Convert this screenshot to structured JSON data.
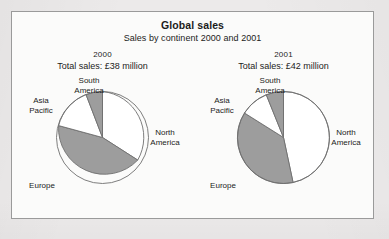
{
  "header": {
    "title": "Global sales",
    "subtitle": "Sales by continent 2000 and 2001"
  },
  "colors": {
    "page_background": "#eceaea",
    "panel_background": "#fbfbfa",
    "panel_border": "#9a9a9a",
    "slice_gray": "#9d9d9d",
    "slice_white": "#ffffff",
    "slice_outline": "#6f6f6f",
    "text": "#1b1b1b"
  },
  "charts": [
    {
      "year": "2000",
      "total": "Total sales: £38 million",
      "labels": {
        "north_america": "North\nAmerica",
        "europe": "Europe",
        "asia_pacific": "Asia\nPacific",
        "south_america": "South\nAmerica"
      }
    },
    {
      "year": "2001",
      "total": "Total sales: £42 million",
      "labels": {
        "north_america": "North\nAmerica",
        "europe": "Europe",
        "asia_pacific": "Asia\nPacific",
        "south_america": "South\nAmerica"
      }
    }
  ],
  "chart_data": [
    {
      "type": "pie",
      "title": "2000",
      "subtitle": "Total sales: £38 million",
      "total_label": "£38 million",
      "total_value": 38,
      "units": "£ million",
      "categories": [
        "North America",
        "Europe",
        "Asia Pacific",
        "South America"
      ],
      "values": [
        36,
        43,
        15,
        6
      ],
      "value_units": "percent",
      "angles_deg": [
        130,
        155,
        54,
        21
      ],
      "start_angle_deg": 0,
      "direction": "clockwise",
      "fills": [
        "#ffffff",
        "#9d9d9d",
        "#ffffff",
        "#9d9d9d"
      ],
      "legend": "none",
      "labels_position": "outside"
    },
    {
      "type": "pie",
      "title": "2001",
      "subtitle": "Total sales: £42 million",
      "total_label": "£42 million",
      "total_value": 42,
      "units": "£ million",
      "categories": [
        "North America",
        "Europe",
        "Asia Pacific",
        "South America"
      ],
      "values": [
        47,
        37,
        10,
        6
      ],
      "value_units": "percent",
      "angles_deg": [
        168,
        134,
        36,
        22
      ],
      "start_angle_deg": 0,
      "direction": "clockwise",
      "fills": [
        "#ffffff",
        "#9d9d9d",
        "#ffffff",
        "#9d9d9d"
      ],
      "legend": "none",
      "labels_position": "outside"
    }
  ]
}
